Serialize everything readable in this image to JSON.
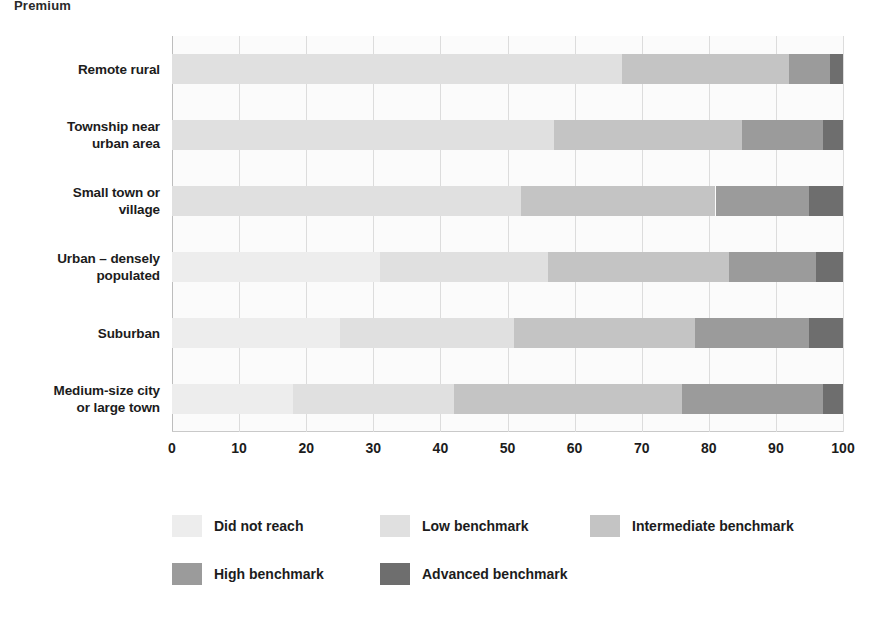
{
  "top_partial_heading": "Premium",
  "chart_data": {
    "type": "bar",
    "orientation": "horizontal",
    "stacked": true,
    "title": "",
    "xlabel": "",
    "ylabel": "",
    "xlim": [
      0,
      100
    ],
    "xticks": [
      0,
      10,
      20,
      30,
      40,
      50,
      60,
      70,
      80,
      90,
      100
    ],
    "xtick_labels": [
      "0",
      "10",
      "20",
      "30",
      "40",
      "50",
      "60",
      "70",
      "80",
      "90",
      "100"
    ],
    "grid": true,
    "legend_position": "bottom",
    "categories": [
      "Remote rural",
      "Township near urban area",
      "Small town or village",
      "Urban – densely populated",
      "Suburban",
      "Medium-size city or large town"
    ],
    "category_lines": [
      [
        "Remote rural"
      ],
      [
        "Township near",
        "urban area"
      ],
      [
        "Small town or",
        "village"
      ],
      [
        "Urban – densely",
        "populated"
      ],
      [
        "Suburban"
      ],
      [
        "Medium-size city",
        "or large town"
      ]
    ],
    "series": [
      {
        "name": "Did not reach",
        "color": "#ededed",
        "values": [
          0,
          0,
          0,
          31,
          25,
          18
        ]
      },
      {
        "name": "Low benchmark",
        "color": "#e0e0e0",
        "values": [
          67,
          57,
          52,
          25,
          26,
          24
        ]
      },
      {
        "name": "Intermediate benchmark",
        "color": "#c4c4c4",
        "values": [
          25,
          28,
          29,
          27,
          27,
          34
        ]
      },
      {
        "name": "High benchmark",
        "color": "#9b9b9b",
        "values": [
          6,
          12,
          14,
          13,
          17,
          21
        ]
      },
      {
        "name": "Advanced benchmark",
        "color": "#6e6e6e",
        "values": [
          2,
          3,
          5,
          4,
          5,
          3
        ]
      }
    ],
    "legend_entries": [
      {
        "label": "Did not reach",
        "color": "#ededed"
      },
      {
        "label": "Low benchmark",
        "color": "#e0e0e0"
      },
      {
        "label": "Intermediate benchmark",
        "color": "#c4c4c4"
      },
      {
        "label": "High benchmark",
        "color": "#9b9b9b"
      },
      {
        "label": "Advanced benchmark",
        "color": "#6e6e6e"
      }
    ]
  }
}
